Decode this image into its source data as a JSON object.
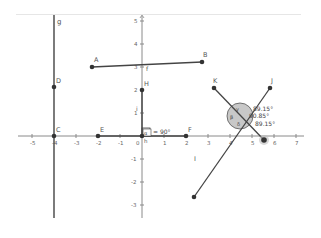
{
  "app": {
    "type": "geometry-graphing-view"
  },
  "axes": {
    "origin_label": "0",
    "x_ticks": [
      "-5",
      "-4",
      "-3",
      "-2",
      "-1",
      "1",
      "2",
      "3",
      "4",
      "5",
      "6",
      "7"
    ],
    "y_ticks": [
      "5",
      "4",
      "3",
      "2",
      "1",
      "-1",
      "-2",
      "-3"
    ]
  },
  "points": {
    "A": "A",
    "B": "B",
    "C": "C",
    "D": "D",
    "E": "E",
    "F": "F",
    "H": "H",
    "K": "K",
    "J": "J",
    "I": "I",
    "L": ""
  },
  "lines": {
    "g": "g",
    "f": "f",
    "i": "i",
    "h": "h"
  },
  "angles": {
    "right_angle_label": "α",
    "right_angle_value": "= 90°",
    "angle1_name": "ε",
    "angle1_value": "89.15°",
    "angle2_name": "γ",
    "angle2_value": "90.85°",
    "angle3_name": "δ",
    "angle3_value": "89.15°",
    "angle4_name": "β"
  },
  "colors": {
    "line": "#333333",
    "point": "#333333",
    "axis": "#7f7f7f",
    "angle_fill": "#c8c8c8",
    "label": "#555555"
  }
}
